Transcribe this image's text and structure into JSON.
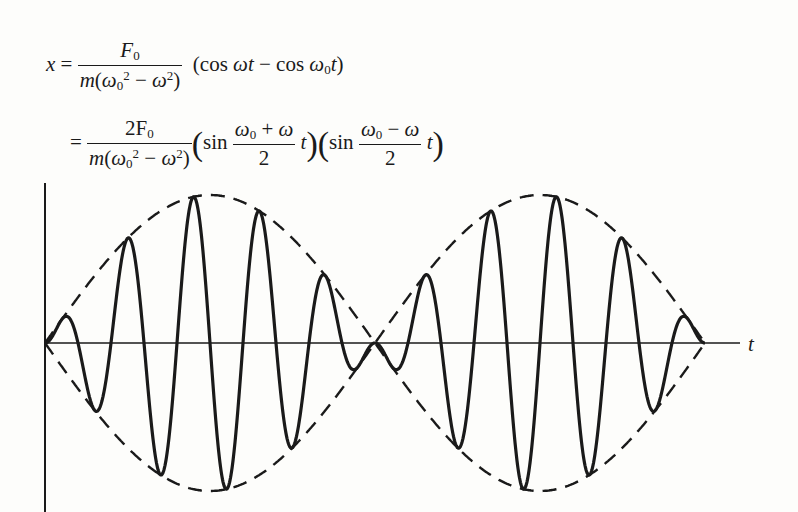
{
  "equation": {
    "line1": {
      "lhs": "x",
      "equals": "=",
      "numerator": "F",
      "numerator_sub": "0",
      "denominator": "m(ω₀² − ω²)",
      "factor": "(cos ωt − cos ω₀t)"
    },
    "line2": {
      "equals": "=",
      "numerator": "2F",
      "numerator_sub": "0",
      "denominator": "m(ω₀² − ω²)",
      "factor1_func": "sin",
      "factor1_frac_num": "ω₀ + ω",
      "factor1_frac_den": "2",
      "factor2_func": "sin",
      "factor2_frac_num": "ω₀ − ω",
      "factor2_frac_den": "2",
      "var": "t"
    }
  },
  "chart_data": {
    "type": "line",
    "title": "",
    "xlabel": "t",
    "ylabel": "x",
    "series": [
      {
        "name": "x(t) = A sin(Ωc t) · sin(Ωe t)",
        "style": "solid",
        "lobes": 2,
        "carrier_half_cycles_per_lobe": 10
      },
      {
        "name": "envelope ±A sin(Ωe t)",
        "style": "dashed"
      }
    ],
    "envelope_nodes_px": [
      45,
      372,
      705
    ],
    "amplitude_px": 148,
    "axis_y_px": 343,
    "colors": {
      "ink": "#1a1a1a",
      "paper": "#fdfdfb"
    }
  }
}
